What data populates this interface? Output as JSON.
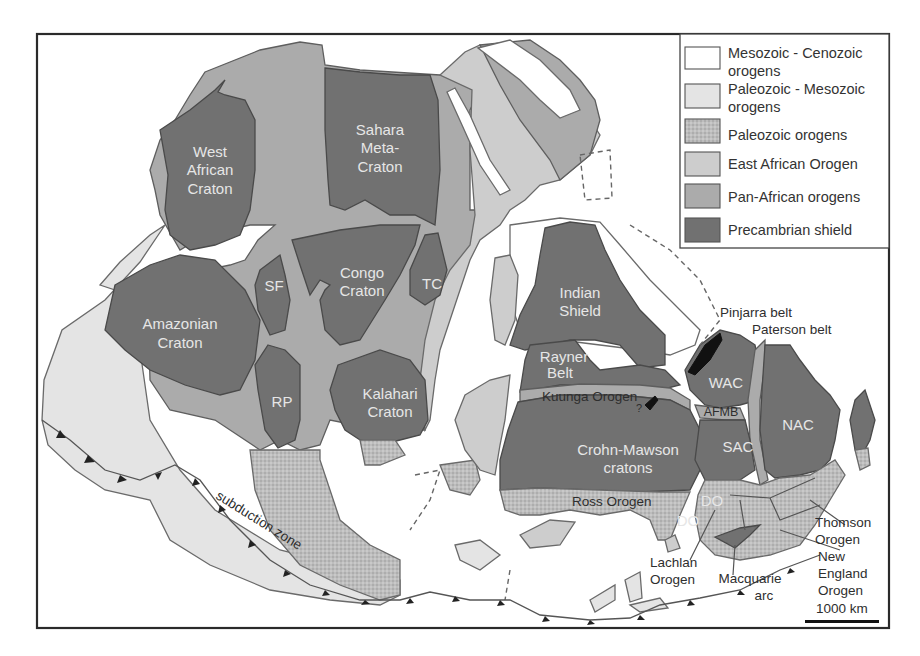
{
  "legend": {
    "items": [
      {
        "line1": "Mesozoic - Cenozoic",
        "line2": "orogens",
        "color": "#ffffff"
      },
      {
        "line1": "Paleozoic - Mesozoic",
        "line2": "orogens",
        "color": "#e4e4e4"
      },
      {
        "line1": "Paleozoic orogens",
        "line2": "",
        "color": "#b8b8b8",
        "pattern": "stippled"
      },
      {
        "line1": "East African Orogen",
        "line2": "",
        "color": "#cdcdcd"
      },
      {
        "line1": "Pan-African orogens",
        "line2": "",
        "color": "#ababab"
      },
      {
        "line1": "Precambrian shield",
        "line2": "",
        "color": "#717171"
      }
    ]
  },
  "cratons": {
    "west_african": [
      "West",
      "African",
      "Craton"
    ],
    "sahara": [
      "Sahara",
      "Meta-",
      "Craton"
    ],
    "amazonian": [
      "Amazonian",
      "Craton"
    ],
    "sf": "SF",
    "congo": [
      "Congo",
      "Craton"
    ],
    "tc": "TC",
    "rp": "RP",
    "kalahari": [
      "Kalahari",
      "Craton"
    ],
    "indian": [
      "Indian",
      "Shield"
    ],
    "rayner": [
      "Rayner",
      "Belt"
    ],
    "crohn_mawson": [
      "Crohn-Mawson",
      "cratons"
    ],
    "wac": "WAC",
    "nac": "NAC",
    "sac": "SAC",
    "afmb": "AFMB",
    "do1": "DO",
    "do2": "DO"
  },
  "annotations": {
    "kuunga": "Kuunga Orogen",
    "ross": "Ross Orogen",
    "pinjarra": "Pinjarra belt",
    "paterson": "Paterson belt",
    "thomson": [
      "Thomson",
      "Orogen"
    ],
    "new_england": [
      "New",
      "England",
      "Orogen"
    ],
    "lachlan": [
      "Lachlan",
      "Orogen"
    ],
    "macquarie": [
      "Macquarie",
      "arc"
    ],
    "subduction": "subduction zone",
    "question": "?"
  },
  "scale_bar": {
    "label": "1000 km"
  },
  "colors": {
    "mesozoic_cenozoic": "#ffffff",
    "paleozoic_mesozoic": "#e4e4e4",
    "paleozoic": "#b8b8b8",
    "east_african": "#cdcdcd",
    "pan_african": "#ababab",
    "precambrian": "#717171"
  }
}
